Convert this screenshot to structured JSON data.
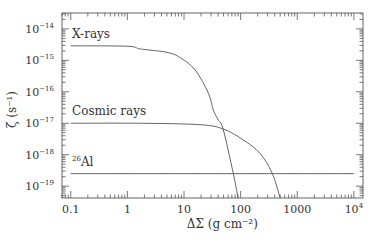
{
  "chart_data": {
    "type": "line",
    "title": "",
    "xlabel": "ΔΣ (g cm⁻²)",
    "ylabel": "ζ (s⁻¹)",
    "xscale": "log",
    "yscale": "log",
    "xlim": [
      0.07,
      14500
    ],
    "ylim": [
      4.2e-20,
      3.2e-14
    ],
    "grid": false,
    "legend": "inline labels",
    "x_ticks": [
      {
        "value": 0.1,
        "label": "0.1"
      },
      {
        "value": 1,
        "label": "1"
      },
      {
        "value": 10,
        "label": "10"
      },
      {
        "value": 100,
        "label": "100"
      },
      {
        "value": 1000,
        "label": "1000"
      },
      {
        "value": 10000,
        "label": "10",
        "sup": "4"
      }
    ],
    "y_ticks": [
      {
        "value": 1e-14,
        "base": "10",
        "sup": "−14"
      },
      {
        "value": 1e-15,
        "base": "10",
        "sup": "−15"
      },
      {
        "value": 1e-16,
        "base": "10",
        "sup": "−16"
      },
      {
        "value": 1e-17,
        "base": "10",
        "sup": "−17"
      },
      {
        "value": 1e-18,
        "base": "10",
        "sup": "−18"
      },
      {
        "value": 1e-19,
        "base": "10",
        "sup": "−19"
      }
    ],
    "series": [
      {
        "name": "X-rays",
        "label": "X-rays",
        "x": [
          0.1,
          1,
          1.7,
          5,
          8.7,
          15.8,
          27,
          33,
          40,
          49,
          74,
          90
        ],
        "y": [
          2.9e-15,
          2.8e-15,
          2.3e-15,
          1.8e-15,
          1.2e-15,
          4.9e-16,
          9e-17,
          2.6e-17,
          1.3e-17,
          6.6e-18,
          2.6e-19,
          3.5e-20
        ]
      },
      {
        "name": "Cosmic rays",
        "label": "Cosmic rays",
        "x": [
          0.1,
          1.7,
          19,
          49,
          110,
          220,
          360,
          500
        ],
        "y": [
          1e-17,
          1e-17,
          9e-18,
          6.6e-18,
          3e-18,
          1.1e-18,
          2.6e-19,
          4.2e-20
        ]
      },
      {
        "name": "26Al",
        "label_sup": "26",
        "label": "Al",
        "x": [
          0.1,
          10000
        ],
        "y": [
          2.5e-19,
          2.5e-19
        ]
      }
    ]
  }
}
